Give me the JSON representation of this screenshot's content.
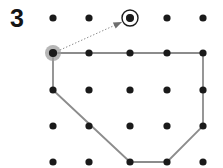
{
  "figure": {
    "label": "3",
    "type": "dot-grid-polygon",
    "width": 223,
    "height": 168,
    "background_color": "#ffffff"
  },
  "grid": {
    "columns": 5,
    "rows": 5,
    "x_positions": [
      53,
      89,
      130,
      167,
      203
    ],
    "y_positions": [
      18,
      53,
      90,
      126,
      162
    ],
    "dot_radius": 3.6,
    "dot_color": "#1a1a1a"
  },
  "polygon": {
    "stroke_color": "#8c8c8c",
    "stroke_width": 1.8,
    "fill": "none",
    "vertices": [
      {
        "x": 53,
        "y": 53
      },
      {
        "x": 203,
        "y": 53
      },
      {
        "x": 203,
        "y": 126
      },
      {
        "x": 167,
        "y": 162
      },
      {
        "x": 130,
        "y": 162
      },
      {
        "x": 53,
        "y": 90
      }
    ]
  },
  "markers": {
    "start_vertex": {
      "x": 53,
      "y": 53,
      "halo_radius": 8,
      "halo_color": "#9a9a9a",
      "dot_color": "#1a1a1a"
    },
    "target_dot": {
      "x": 130,
      "y": 18,
      "ring_radius": 8,
      "ring_color": "#1a1a1a",
      "dot_color": "#1a1a1a"
    }
  },
  "arrow": {
    "from": {
      "x": 60,
      "y": 50
    },
    "to": {
      "x": 122,
      "y": 22
    },
    "style": "dotted",
    "color": "#8c8c8c",
    "head_color": "#6e6e6e"
  }
}
